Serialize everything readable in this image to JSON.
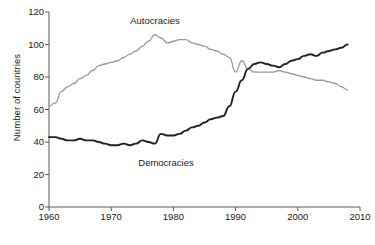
{
  "chart_data": {
    "type": "line",
    "title": "",
    "subtitle": "",
    "xlabel": "",
    "ylabel": "Number of countries",
    "xlim": [
      1960,
      2010
    ],
    "ylim": [
      0,
      120
    ],
    "grid": false,
    "legend_position": "inline-annotations",
    "xticks": [
      "1960",
      "1970",
      "1980",
      "1990",
      "2000",
      "2010"
    ],
    "xtick_values": [
      1960,
      1970,
      1980,
      1990,
      2000,
      2010
    ],
    "yticks": [
      "0",
      "20",
      "40",
      "60",
      "80",
      "100",
      "120"
    ],
    "ytick_values": [
      0,
      20,
      40,
      60,
      80,
      100,
      120
    ],
    "x": [
      1960,
      1961,
      1962,
      1963,
      1964,
      1965,
      1966,
      1967,
      1968,
      1969,
      1970,
      1971,
      1972,
      1973,
      1974,
      1975,
      1976,
      1977,
      1978,
      1979,
      1980,
      1981,
      1982,
      1983,
      1984,
      1985,
      1986,
      1987,
      1988,
      1989,
      1990,
      1991,
      1992,
      1993,
      1994,
      1995,
      1996,
      1997,
      1998,
      1999,
      2000,
      2001,
      2002,
      2003,
      2004,
      2005,
      2006,
      2007,
      2008
    ],
    "series": [
      {
        "name": "Autocracies",
        "color": "#9a9a9a",
        "label_position": {
          "x": 155,
          "y": 16
        },
        "values": [
          62,
          64,
          71,
          74,
          76,
          79,
          81,
          84,
          87,
          88,
          89,
          90,
          92,
          94,
          96,
          99,
          102,
          106,
          104,
          101,
          102,
          103,
          103,
          101,
          100,
          99,
          97,
          96,
          94,
          92,
          83,
          90,
          85,
          83,
          83,
          83,
          83,
          84,
          83,
          82,
          81,
          80,
          79,
          78,
          78,
          77,
          76,
          74,
          72
        ]
      },
      {
        "name": "Democracies",
        "color": "#222222",
        "label_position": {
          "x": 166,
          "y": 158
        },
        "values": [
          43,
          43,
          42,
          41,
          41,
          42,
          41,
          41,
          40,
          39,
          38,
          38,
          39,
          38,
          39,
          41,
          40,
          39,
          45,
          44,
          44,
          45,
          47,
          49,
          50,
          52,
          54,
          55,
          56,
          62,
          71,
          78,
          85,
          88,
          89,
          88,
          87,
          86,
          88,
          90,
          91,
          93,
          94,
          93,
          95,
          96,
          97,
          98,
          100
        ]
      }
    ],
    "annotations": [
      {
        "text": "Autocracies",
        "x": 1977,
        "y": 119
      },
      {
        "text": "Democracies",
        "x": 1981,
        "y": 27
      }
    ]
  },
  "axes": {
    "y_axis_title": "Number of countries"
  }
}
